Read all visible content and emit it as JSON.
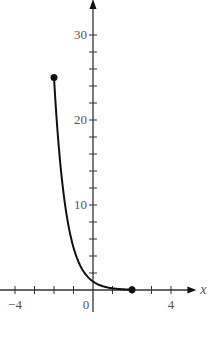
{
  "chart_data": {
    "type": "line",
    "title": "",
    "xlabel": "x",
    "ylabel": "y",
    "xlim": [
      -4.7,
      5.3
    ],
    "ylim": [
      -2,
      34
    ],
    "x_ticks_labeled": [
      "-4",
      "0",
      "4"
    ],
    "y_ticks_labeled": [
      "10",
      "20",
      "30"
    ],
    "x_tick_step": 1,
    "y_tick_step": 2,
    "grid": false,
    "function": "y = 5^(-x)",
    "domain": [
      -2,
      2
    ],
    "series": [
      {
        "name": "y = 5^(-x)",
        "x": [
          -2,
          -1.5,
          -1,
          -0.5,
          0,
          0.5,
          1,
          1.5,
          2
        ],
        "y": [
          25,
          11.18,
          5,
          2.24,
          1,
          0.45,
          0.2,
          0.09,
          0.04
        ]
      }
    ],
    "endpoints": [
      {
        "x": -2,
        "y": 25,
        "closed": true
      },
      {
        "x": 2,
        "y": 0.04,
        "closed": true
      }
    ],
    "color": "#111111"
  }
}
